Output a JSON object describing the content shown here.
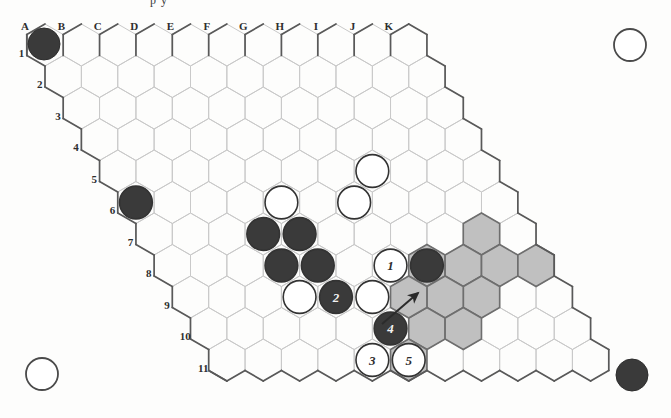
{
  "figure": {
    "kind": "hex-board-diagram",
    "clipped_caption": "p y",
    "board_shape": "rhombus",
    "columns": [
      "A",
      "B",
      "C",
      "D",
      "E",
      "F",
      "G",
      "H",
      "I",
      "J",
      "K"
    ],
    "rows": [
      "1",
      "2",
      "3",
      "4",
      "5",
      "6",
      "7",
      "8",
      "9",
      "10",
      "11"
    ]
  },
  "colors": {
    "black_stone": "#3a3a3a",
    "white_stone": "#ffffff",
    "stone_outline": "#333333",
    "grid_line": "#c9c9c9",
    "border_line": "#595959",
    "shaded_region": "#b5b5b5",
    "shaded_outline": "#6e6e6e",
    "page_background": "#fdfdfc"
  },
  "corner_markers": [
    {
      "name": "top-left",
      "fill": "black"
    },
    {
      "name": "top-right",
      "fill": "white"
    },
    {
      "name": "bottom-left",
      "fill": "white"
    },
    {
      "name": "bottom-right",
      "fill": "black"
    }
  ],
  "stones": [
    {
      "id": "s1",
      "cx": 72,
      "cy": 224,
      "fill": "black"
    },
    {
      "id": "s2",
      "cx": 253,
      "cy": 249,
      "fill": "black"
    },
    {
      "id": "s3",
      "cx": 287,
      "cy": 211,
      "fill": "white"
    },
    {
      "id": "s4",
      "cx": 347,
      "cy": 211,
      "fill": "white"
    },
    {
      "id": "s5",
      "cx": 374,
      "cy": 160,
      "fill": "white"
    },
    {
      "id": "s6",
      "cx": 285,
      "cy": 262,
      "fill": "black"
    },
    {
      "id": "s7",
      "cx": 316,
      "cy": 281,
      "fill": "black"
    },
    {
      "id": "s8",
      "cx": 316,
      "cy": 244,
      "fill": "black"
    },
    {
      "id": "s9",
      "cx": 316,
      "cy": 299,
      "fill": "white"
    },
    {
      "id": "s10",
      "cx": 378,
      "cy": 283,
      "fill": "white"
    },
    {
      "id": "s11",
      "cx": 436,
      "cy": 261,
      "fill": "black"
    }
  ],
  "move_markers": [
    {
      "label": "1",
      "cx": 375,
      "cy": 261,
      "fill": "white",
      "text_color": "#2e2e2e"
    },
    {
      "label": "2",
      "cx": 347,
      "cy": 309,
      "fill": "black",
      "text_color": "#f2f2f2"
    },
    {
      "label": "4",
      "cx": 375,
      "cy": 331,
      "fill": "black",
      "text_color": "#f2f2f2"
    },
    {
      "label": "3",
      "cx": 375,
      "cy": 371,
      "fill": "white",
      "text_color": "#2e2e2e"
    },
    {
      "label": "5",
      "cx": 406,
      "cy": 350,
      "fill": "white",
      "text_color": "#2e2e2e"
    }
  ],
  "arrow": {
    "name": "move-direction-arrow",
    "from_x": 382,
    "from_y": 324,
    "to_x": 418,
    "to_y": 293
  },
  "shaded_cells": [
    {
      "cx": 436,
      "cy": 261
    },
    {
      "cx": 466,
      "cy": 243
    },
    {
      "cx": 466,
      "cy": 279
    },
    {
      "cx": 496,
      "cy": 261
    },
    {
      "cx": 496,
      "cy": 297
    },
    {
      "cx": 436,
      "cy": 297
    },
    {
      "cx": 436,
      "cy": 333
    },
    {
      "cx": 466,
      "cy": 315
    },
    {
      "cx": 406,
      "cy": 315
    },
    {
      "cx": 406,
      "cy": 350
    },
    {
      "cx": 527,
      "cy": 279
    }
  ]
}
